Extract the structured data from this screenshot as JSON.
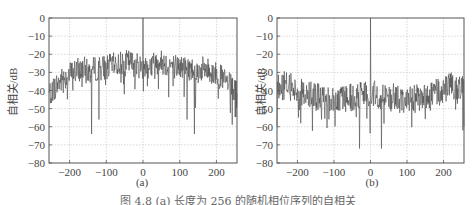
{
  "chart_data": [
    {
      "type": "line",
      "panel_label": "(a)",
      "title": "",
      "xlabel": "",
      "ylabel": "自相关/dB",
      "xlim": [
        -256,
        256
      ],
      "ylim": [
        -80,
        0
      ],
      "xticks": [
        -200,
        -100,
        0,
        100,
        200
      ],
      "yticks": [
        0,
        -10,
        -20,
        -30,
        -40,
        -50,
        -60,
        -70,
        -80
      ],
      "grid": true,
      "description": "Autocorrelation of a length-256 sequence: main peak 0 dB at lag 0; sidelobes form a dome around -25 to -30 dB near center, falling to about -40 dB at edges; deep nulls reaching ~-64 dB near lags ±140 and ~-56 dB near ±120",
      "series": [
        {
          "name": "autocorrelation (a)",
          "x": [
            -256,
            -240,
            -220,
            -200,
            -180,
            -160,
            -150,
            -140,
            -130,
            -120,
            -100,
            -80,
            -60,
            -40,
            -20,
            -5,
            0,
            5,
            20,
            40,
            60,
            80,
            100,
            120,
            130,
            140,
            150,
            160,
            180,
            200,
            220,
            240,
            256
          ],
          "values": [
            -42,
            -38,
            -34,
            -31,
            -29,
            -28,
            -30,
            -64,
            -28,
            -56,
            -27,
            -26,
            -25,
            -24,
            -26,
            -27,
            0,
            -27,
            -26,
            -24,
            -25,
            -26,
            -27,
            -56,
            -28,
            -64,
            -30,
            -28,
            -29,
            -31,
            -34,
            -38,
            -42
          ]
        }
      ]
    },
    {
      "type": "line",
      "panel_label": "(b)",
      "title": "",
      "xlabel": "",
      "ylabel": "自相关/dB",
      "xlim": [
        -256,
        256
      ],
      "ylim": [
        -80,
        0
      ],
      "xticks": [
        -200,
        -100,
        0,
        100,
        200
      ],
      "yticks": [
        0,
        -10,
        -20,
        -30,
        -40,
        -50,
        -60,
        -70,
        -80
      ],
      "grid": true,
      "description": "Autocorrelation of a length-256 sequence: main peak 0 dB at lag 0; sidelobes roughly flat around -40 to -45 dB, with deep nulls of about -72 dB at lags ±30 and drops to about -60 dB at the edges",
      "series": [
        {
          "name": "autocorrelation (b)",
          "x": [
            -256,
            -250,
            -230,
            -200,
            -150,
            -100,
            -60,
            -30,
            -10,
            0,
            10,
            30,
            60,
            100,
            150,
            200,
            230,
            250,
            256
          ],
          "values": [
            -60,
            -38,
            -37,
            -40,
            -44,
            -45,
            -44,
            -72,
            -42,
            0,
            -42,
            -72,
            -44,
            -45,
            -44,
            -40,
            -37,
            -38,
            -60
          ]
        }
      ]
    }
  ],
  "figure": {
    "ylabel": "自相关/dB",
    "xtick_labels": [
      "-200",
      "-100",
      "0",
      "100",
      "200"
    ],
    "ytick_labels": [
      "0",
      "-10",
      "-20",
      "-30",
      "-40",
      "-50",
      "-60",
      "-70",
      "-80"
    ],
    "panel_a_label": "(a)",
    "panel_b_label": "(b)",
    "caption": "图 4.8 (a) 长度为 256 的随机相位序列的自相关"
  },
  "colors": {
    "line": "#4a4a4a",
    "axis": "#555555",
    "grid": "#c8c8c8",
    "text": "#444444"
  }
}
